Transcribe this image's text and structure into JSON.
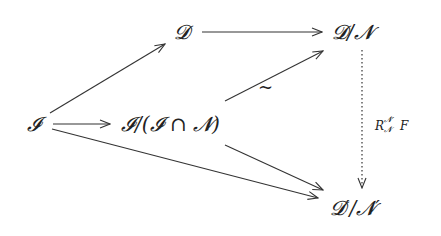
{
  "diagram": {
    "type": "commutative-diagram",
    "nodes": {
      "I": "𝓘",
      "D": "𝓓",
      "D_over_N": "𝓓/𝓝",
      "I_quot": "𝓘/(𝓘 ∩ 𝓝)",
      "Dp_over_Np": "𝓓′/𝓝′"
    },
    "edges": [
      {
        "from": "I",
        "to": "D",
        "style": "solid"
      },
      {
        "from": "D",
        "to": "D_over_N",
        "style": "solid"
      },
      {
        "from": "I",
        "to": "I_quot",
        "style": "solid"
      },
      {
        "from": "I_quot",
        "to": "D_over_N",
        "style": "solid",
        "label": "~"
      },
      {
        "from": "I_quot",
        "to": "Dp_over_Np",
        "style": "solid"
      },
      {
        "from": "I",
        "to": "Dp_over_Np",
        "style": "solid"
      },
      {
        "from": "D_over_N",
        "to": "Dp_over_Np",
        "style": "dotted",
        "label": "R F"
      }
    ],
    "labels": {
      "tilde": "~",
      "R": "R",
      "R_sup": "𝓝′",
      "R_sub": "𝓝",
      "F": "F"
    },
    "colors": {
      "stroke": "#333333",
      "text": "#222222",
      "background": "#ffffff"
    }
  }
}
